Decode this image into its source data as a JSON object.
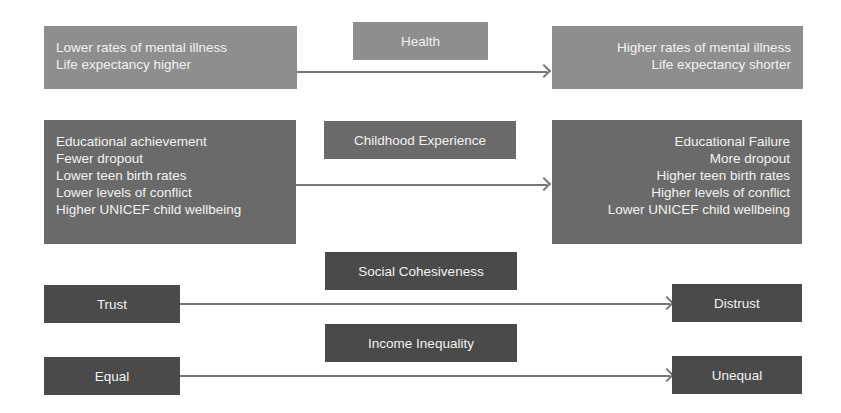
{
  "rows": [
    {
      "category": "Health",
      "left": [
        "Lower rates of mental illness",
        "Life expectancy higher"
      ],
      "right": [
        "Higher rates of mental illness",
        "Life expectancy shorter"
      ]
    },
    {
      "category": "Childhood Experience",
      "left": [
        "Educational achievement",
        "Fewer dropout",
        "Lower teen birth rates",
        "Lower levels of conflict",
        "Higher UNICEF child wellbeing"
      ],
      "right": [
        "Educational Failure",
        "More dropout",
        "Higher teen birth rates",
        "Higher levels of conflict",
        "Lower UNICEF child wellbeing"
      ]
    },
    {
      "category": "Social Cohesiveness",
      "left": [
        "Trust"
      ],
      "right": [
        "Distrust"
      ]
    },
    {
      "category": "Income Inequality",
      "left": [
        "Equal"
      ],
      "right": [
        "Unequal"
      ]
    }
  ],
  "colors": {
    "health_boxes": "#8e8e8e",
    "childhood_boxes": "#6a6a6a",
    "cohesion_boxes": "#4a4a4a",
    "arrow": "#777777",
    "text": "#f2f2f2"
  }
}
